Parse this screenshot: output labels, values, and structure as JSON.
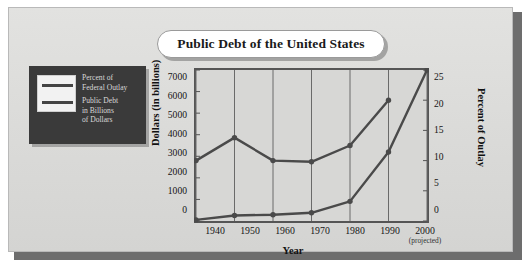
{
  "figure": {
    "title": "Public Debt of the United States",
    "colors": {
      "panel_background": "#dcdcdc",
      "legend_panel": "#3a3a3a",
      "plot_background": "#d7d7d5",
      "line": "#4a4a4a",
      "frame": "#555555"
    }
  },
  "legend": {
    "entries": [
      {
        "label_line1": "Percent of",
        "label_line2": "Federal Outlay",
        "label_line3": ""
      },
      {
        "label_line1": "Public Debt",
        "label_line2": "in Billions",
        "label_line3": "of Dollars"
      }
    ]
  },
  "axes": {
    "left_title": "Dollars (in billions)",
    "right_title": "Percent of Outlay",
    "x_title": "Year",
    "left_ticks": [
      "7000",
      "6000",
      "5000",
      "4000",
      "3000",
      "2000",
      "1000",
      "0"
    ],
    "right_ticks": [
      "25",
      "20",
      "15",
      "10",
      "5",
      "0"
    ],
    "x_ticks": [
      "1940",
      "1950",
      "1960",
      "1970",
      "1980",
      "1990",
      "2000"
    ],
    "x_tick_note": "(projected)"
  },
  "chart_data": {
    "type": "line",
    "title": "Public Debt of the United States",
    "xlabel": "Year",
    "ylabel": "Dollars (in billions)",
    "y2label": "Percent of Outlay",
    "x": [
      1940,
      1950,
      1960,
      1970,
      1980,
      1990,
      2000
    ],
    "xticklabels": [
      "1940",
      "1950",
      "1960",
      "1970",
      "1980",
      "1990",
      "2000 (projected)"
    ],
    "ylim": [
      0,
      7000
    ],
    "y2lim": [
      0,
      25
    ],
    "grid": "vertical",
    "legend_position": "outside-left",
    "series": [
      {
        "name": "Percent of Federal Outlay",
        "axis": "right",
        "units": "percent",
        "x": [
          1940,
          1950,
          1960,
          1970,
          1980,
          1990
        ],
        "values": [
          10.0,
          13.8,
          10.0,
          9.8,
          12.5,
          20.0
        ]
      },
      {
        "name": "Public Debt in Billions of Dollars",
        "axis": "left",
        "units": "billions of dollars",
        "x": [
          1940,
          1950,
          1960,
          1970,
          1980,
          1990,
          2000
        ],
        "values": [
          50,
          257,
          290,
          380,
          910,
          3200,
          7000
        ]
      }
    ]
  }
}
